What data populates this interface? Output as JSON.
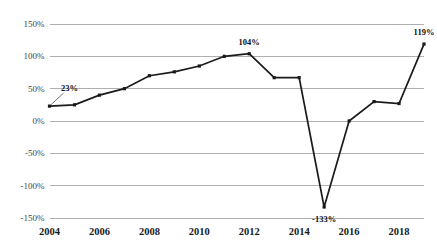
{
  "chart_data": {
    "type": "line",
    "title": "",
    "subtitle": "",
    "xlabel": "",
    "ylabel": "",
    "x": [
      2004,
      2005,
      2006,
      2007,
      2008,
      2009,
      2010,
      2011,
      2012,
      2013,
      2014,
      2015,
      2016,
      2017,
      2018,
      2019
    ],
    "values": [
      23,
      25,
      40,
      50,
      70,
      76,
      85,
      100,
      104,
      67,
      67,
      -133,
      0,
      30,
      27,
      119
    ],
    "series": [
      {
        "name": "",
        "values": [
          23,
          25,
          40,
          50,
          70,
          76,
          85,
          100,
          104,
          67,
          67,
          -133,
          0,
          30,
          27,
          119
        ]
      }
    ],
    "ylim": [
      -150,
      150
    ],
    "xlim": [
      2004,
      2019
    ],
    "y_ticks": [
      150,
      100,
      50,
      0,
      -50,
      -100,
      -150
    ],
    "y_tick_labels": [
      "150%",
      "100%",
      "50%",
      "0%",
      "-50%",
      "-100%",
      "-150%"
    ],
    "x_ticks": [
      2004,
      2006,
      2008,
      2010,
      2012,
      2014,
      2016,
      2018
    ],
    "x_tick_labels": [
      "2004",
      "2006",
      "2008",
      "2010",
      "2012",
      "2014",
      "2016",
      "2018"
    ],
    "grid": true,
    "grid_axis": "y",
    "legend": false,
    "legend_position": "none",
    "marker": "square",
    "line_color": "#1a1a1a",
    "marker_color": "#1a1a1a",
    "grid_color": "#a6a6a6",
    "background_color": "#ffffff",
    "annotations": [
      {
        "label": "23%",
        "x": 2004,
        "y": 23,
        "placement": "leader-upper-right"
      },
      {
        "label": "104%",
        "x": 2012,
        "y": 104,
        "placement": "above"
      },
      {
        "label": "-133%",
        "x": 2015,
        "y": -133,
        "placement": "below"
      },
      {
        "label": "119%",
        "x": 2019,
        "y": 119,
        "placement": "above"
      }
    ]
  },
  "axes": {
    "y_labels": [
      "150%",
      "100%",
      "50%",
      "0%",
      "-50%",
      "-100%",
      "-150%"
    ],
    "x_labels": [
      "2004",
      "2006",
      "2008",
      "2010",
      "2012",
      "2014",
      "2016",
      "2018"
    ]
  },
  "annotation_labels": {
    "first": "23%",
    "peak": "104%",
    "trough": "-133%",
    "last": "119%"
  }
}
